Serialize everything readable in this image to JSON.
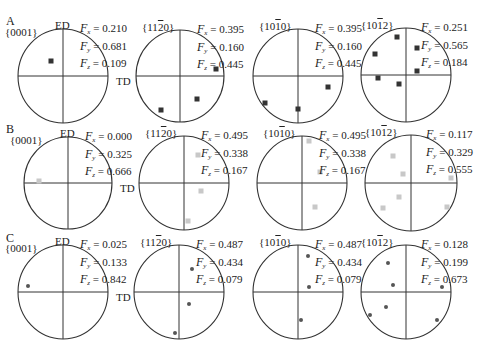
{
  "figure": {
    "rows": [
      {
        "letter": "A",
        "ed_label": "ED",
        "td_label": "TD",
        "point_style": "square",
        "point_color": "#333333",
        "panels": [
          {
            "plane": "{0001}",
            "plane_parts": [
              "{000",
              "1",
              "}"
            ],
            "overbar": "",
            "Fx": "0.210",
            "Fy": "0.681",
            "Fz": "0.109",
            "cx": 63,
            "cy": 76,
            "r": 45,
            "points": [
              [
                51,
                61
              ]
            ]
          },
          {
            "plane": "{11̅20}",
            "plane_parts": [
              "{11",
              "2",
              "0}"
            ],
            "overbar": "2",
            "Fx": "0.395",
            "Fy": "0.160",
            "Fz": "0.445",
            "cx": 180,
            "cy": 76,
            "r": 44,
            "points": [
              [
                216,
                69
              ],
              [
                197,
                99
              ],
              [
                161,
                110
              ]
            ]
          },
          {
            "plane": "{10̅10}",
            "plane_parts": [
              "{10",
              "1",
              "0}"
            ],
            "overbar": "1",
            "Fx": "0.395",
            "Fy": "0.160",
            "Fz": "0.445",
            "cx": 298,
            "cy": 76,
            "r": 45,
            "points": [
              [
                328,
                87
              ],
              [
                265,
                103
              ],
              [
                298,
                109
              ]
            ]
          },
          {
            "plane": "{10̅12}",
            "plane_parts": [
              "{10",
              "1",
              "2}"
            ],
            "overbar": "1",
            "Fx": "0.251",
            "Fy": "0.565",
            "Fz": "0.184",
            "cx": 406,
            "cy": 75,
            "r": 45,
            "points": [
              [
                397,
                37
              ],
              [
                417,
                48
              ],
              [
                375,
                54
              ],
              [
                417,
                71
              ],
              [
                378,
                78
              ],
              [
                399,
                84
              ]
            ]
          }
        ]
      },
      {
        "letter": "B",
        "ed_label": "ED",
        "td_label": "TD",
        "point_style": "square",
        "point_color": "#c8c8c8",
        "panels": [
          {
            "plane": "{0001}",
            "plane_parts": [
              "{000",
              "1",
              "}"
            ],
            "overbar": "",
            "Fx": "0.000",
            "Fy": "0.325",
            "Fz": "0.666",
            "cx": 68,
            "cy": 183,
            "r": 44,
            "points": [
              [
                39,
                181
              ]
            ]
          },
          {
            "plane": "{11̅20}",
            "plane_parts": [
              "{11",
              "2",
              "0}"
            ],
            "overbar": "2",
            "Fx": "0.495",
            "Fy": "0.338",
            "Fz": "0.167",
            "cx": 184,
            "cy": 183,
            "r": 45,
            "points": [
              [
                198,
                155
              ],
              [
                201,
                191
              ],
              [
                188,
                221
              ]
            ]
          },
          {
            "plane": "{10̅10}",
            "plane_parts": [
              "{10",
              "1",
              "0}"
            ],
            "overbar": "1",
            "Fx": "0.495",
            "Fy": "0.338",
            "Fz": "0.167",
            "cx": 302,
            "cy": 183,
            "r": 45,
            "points": [
              [
                309,
                141
              ],
              [
                320,
                172
              ],
              [
                315,
                207
              ]
            ]
          },
          {
            "plane": "{10̅12}",
            "plane_parts": [
              "{10",
              "1",
              "2}"
            ],
            "overbar": "1",
            "Fx": "0.117",
            "Fy": "0.329",
            "Fz": "0.555",
            "cx": 411,
            "cy": 183,
            "r": 46,
            "points": [
              [
                393,
                156
              ],
              [
                403,
                174
              ],
              [
                451,
                178
              ],
              [
                399,
                197
              ],
              [
                383,
                208
              ],
              [
                447,
                207
              ]
            ]
          }
        ]
      },
      {
        "letter": "C",
        "ed_label": "ED",
        "td_label": "TD",
        "point_style": "dot",
        "point_color": "#555555",
        "panels": [
          {
            "plane": "{0001}",
            "plane_parts": [
              "{000",
              "1",
              "}"
            ],
            "overbar": "",
            "Fx": "0.025",
            "Fy": "0.133",
            "Fz": "0.842",
            "cx": 63,
            "cy": 292,
            "r": 45,
            "points": [
              [
                28,
                286
              ]
            ]
          },
          {
            "plane": "{11̅20}",
            "plane_parts": [
              "{11",
              "2",
              "0}"
            ],
            "overbar": "2",
            "Fx": "0.487",
            "Fy": "0.434",
            "Fz": "0.079",
            "cx": 179,
            "cy": 292,
            "r": 45,
            "points": [
              [
                192,
                269
              ],
              [
                189,
                304
              ],
              [
                175,
                333
              ]
            ]
          },
          {
            "plane": "{10̅10}",
            "plane_parts": [
              "{10",
              "1",
              "0}"
            ],
            "overbar": "1",
            "Fx": "0.487",
            "Fy": "0.434",
            "Fz": "0.079",
            "cx": 298,
            "cy": 292,
            "r": 45,
            "points": [
              [
                308,
                256
              ],
              [
                309,
                287
              ],
              [
                301,
                320
              ]
            ]
          },
          {
            "plane": "{10̅12}",
            "plane_parts": [
              "{10",
              "1",
              "2}"
            ],
            "overbar": "1",
            "Fx": "0.128",
            "Fy": "0.199",
            "Fz": "0.673",
            "cx": 406,
            "cy": 292,
            "r": 45,
            "points": [
              [
                388,
                263
              ],
              [
                393,
                285
              ],
              [
                442,
                287
              ],
              [
                386,
                307
              ],
              [
                370,
                315
              ],
              [
                437,
                320
              ]
            ]
          }
        ]
      }
    ]
  }
}
